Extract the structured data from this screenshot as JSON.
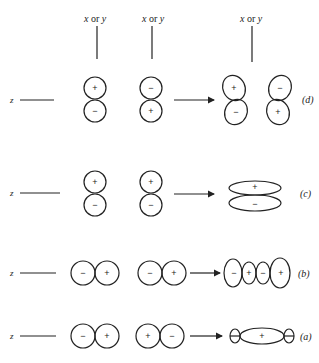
{
  "axis_labels": {
    "vertical": "x or y",
    "vertical_it1": "x",
    "vertical_or": "or",
    "vertical_it2": "y",
    "horizontal": "z"
  },
  "rows": [
    {
      "id": "d",
      "label": "(d)",
      "left_pair": [
        "+",
        "−"
      ],
      "right_pair": [
        "−",
        "+"
      ],
      "result": [
        "+",
        "−",
        "−",
        "+"
      ],
      "orientation": "vertical"
    },
    {
      "id": "c",
      "label": "(c)",
      "left_pair": [
        "+",
        "−"
      ],
      "right_pair": [
        "+",
        "−"
      ],
      "result": [
        "+",
        "−"
      ],
      "orientation": "vertical"
    },
    {
      "id": "b",
      "label": "(b)",
      "left_pair": [
        "−",
        "+"
      ],
      "right_pair": [
        "−",
        "+"
      ],
      "result": [
        "−",
        "+",
        "−",
        "+"
      ],
      "orientation": "horizontal"
    },
    {
      "id": "a",
      "label": "(a)",
      "left_pair": [
        "−",
        "+"
      ],
      "right_pair": [
        "+",
        "−"
      ],
      "result": [
        "+"
      ],
      "orientation": "horizontal"
    }
  ],
  "colors": {
    "ink": "#222222",
    "background": "#ffffff"
  }
}
